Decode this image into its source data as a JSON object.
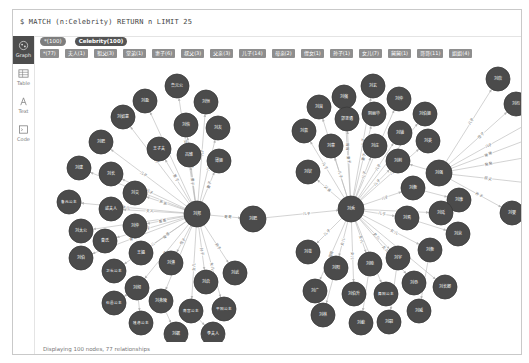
{
  "query": {
    "text": "$ MATCH (n:Celebrity) RETURN n LIMIT 25"
  },
  "sidebar": {
    "items": [
      {
        "id": "graph",
        "label": "Graph",
        "icon": "graph-icon",
        "active": true
      },
      {
        "id": "table",
        "label": "Table",
        "icon": "table-icon",
        "active": false
      },
      {
        "id": "text",
        "label": "Text",
        "icon": "text-icon",
        "active": false
      },
      {
        "id": "code",
        "label": "Code",
        "icon": "code-icon",
        "active": false
      }
    ]
  },
  "labels": [
    {
      "text": "*(100)",
      "style": "light"
    },
    {
      "text": "Celebrity(100)",
      "style": "dark"
    }
  ],
  "relationship_types": [
    "*(77)",
    "夫人(1)",
    "祖父(3)",
    "堂弟(1)",
    "妻子(6)",
    "叔父(3)",
    "父亲(3)",
    "儿子(14)",
    "母亲(2)",
    "侄女(1)",
    "孙子(1)",
    "女儿(7)",
    "舅舅(1)",
    "哥哥(11)",
    "姐姐(4)"
  ],
  "status": {
    "text": "Displaying 100 nodes, 77 relationships"
  },
  "colors": {
    "node": "#4b4b4b",
    "node_stroke": "#3a3a3a",
    "edge": "#b5b5b5",
    "node_text": "#ffffff",
    "edge_text": "#666666"
  },
  "graph": {
    "nodes": [
      {
        "id": "L",
        "x": 196,
        "y": 213,
        "label": "刘邦"
      },
      {
        "id": "M",
        "x": 252,
        "y": 218,
        "label": "刘肥"
      },
      {
        "id": "R",
        "x": 350,
        "y": 208,
        "label": "刘秀"
      },
      {
        "id": "R2",
        "x": 438,
        "y": 172,
        "label": "刘强"
      },
      {
        "id": "l1",
        "x": 176,
        "y": 85,
        "label": "鲁元公"
      },
      {
        "id": "l2",
        "x": 144,
        "y": 100,
        "label": "刘盈"
      },
      {
        "id": "l3",
        "x": 205,
        "y": 101,
        "label": "刘恒"
      },
      {
        "id": "l4",
        "x": 122,
        "y": 116,
        "label": "刘如意"
      },
      {
        "id": "l5",
        "x": 185,
        "y": 124,
        "label": "刘恢"
      },
      {
        "id": "l6",
        "x": 217,
        "y": 127,
        "label": "刘友"
      },
      {
        "id": "l7",
        "x": 100,
        "y": 141,
        "label": "刘肥"
      },
      {
        "id": "l8",
        "x": 158,
        "y": 148,
        "label": "王子夫"
      },
      {
        "id": "l9",
        "x": 188,
        "y": 154,
        "label": "吕雉"
      },
      {
        "id": "l10",
        "x": 218,
        "y": 160,
        "label": "薄姬"
      },
      {
        "id": "l11",
        "x": 78,
        "y": 167,
        "label": "刘建"
      },
      {
        "id": "l12",
        "x": 110,
        "y": 173,
        "label": "刘长"
      },
      {
        "id": "l13",
        "x": 134,
        "y": 192,
        "label": "刘交"
      },
      {
        "id": "l14",
        "x": 68,
        "y": 201,
        "label": "鲁元公主"
      },
      {
        "id": "l15",
        "x": 110,
        "y": 208,
        "label": "戚夫人"
      },
      {
        "id": "l16",
        "x": 80,
        "y": 230,
        "label": "刘太公"
      },
      {
        "id": "l17",
        "x": 134,
        "y": 225,
        "label": "刘仲"
      },
      {
        "id": "l18",
        "x": 104,
        "y": 240,
        "label": "曹氏"
      },
      {
        "id": "l19",
        "x": 80,
        "y": 257,
        "label": "刘伯"
      },
      {
        "id": "l20",
        "x": 140,
        "y": 252,
        "label": "王媪"
      },
      {
        "id": "l21",
        "x": 113,
        "y": 270,
        "label": "卫长公主"
      },
      {
        "id": "l22",
        "x": 170,
        "y": 262,
        "label": "刘濞"
      },
      {
        "id": "l23",
        "x": 205,
        "y": 281,
        "label": "刘启"
      },
      {
        "id": "l24",
        "x": 234,
        "y": 272,
        "label": "刘武"
      },
      {
        "id": "l25",
        "x": 136,
        "y": 287,
        "label": "刘彻"
      },
      {
        "id": "l26",
        "x": 113,
        "y": 302,
        "label": "石邑公主"
      },
      {
        "id": "l27",
        "x": 160,
        "y": 300,
        "label": "刘弗陵"
      },
      {
        "id": "l28",
        "x": 190,
        "y": 310,
        "label": "南宫公主"
      },
      {
        "id": "l29",
        "x": 223,
        "y": 308,
        "label": "平阳公主"
      },
      {
        "id": "l30",
        "x": 140,
        "y": 322,
        "label": "隆虑公主"
      },
      {
        "id": "l31",
        "x": 175,
        "y": 333,
        "label": "刘据"
      },
      {
        "id": "l32",
        "x": 212,
        "y": 333,
        "label": "李夫人"
      },
      {
        "id": "r1",
        "x": 372,
        "y": 85,
        "label": "刘玄"
      },
      {
        "id": "r2",
        "x": 343,
        "y": 96,
        "label": "刘縯"
      },
      {
        "id": "r3",
        "x": 318,
        "y": 106,
        "label": "刘良"
      },
      {
        "id": "r4",
        "x": 398,
        "y": 98,
        "label": "刘仲"
      },
      {
        "id": "r5",
        "x": 346,
        "y": 118,
        "label": "郭圣通"
      },
      {
        "id": "r6",
        "x": 373,
        "y": 113,
        "label": "阴丽华"
      },
      {
        "id": "r7",
        "x": 424,
        "y": 113,
        "label": "刘伯姬"
      },
      {
        "id": "r8",
        "x": 303,
        "y": 130,
        "label": "刘嘉"
      },
      {
        "id": "r9",
        "x": 330,
        "y": 145,
        "label": "刘章"
      },
      {
        "id": "r10",
        "x": 374,
        "y": 145,
        "label": "刘庄"
      },
      {
        "id": "r11",
        "x": 399,
        "y": 132,
        "label": "刘辅"
      },
      {
        "id": "r12",
        "x": 427,
        "y": 140,
        "label": "刘英"
      },
      {
        "id": "r13",
        "x": 307,
        "y": 171,
        "label": "刘钦"
      },
      {
        "id": "r14",
        "x": 397,
        "y": 160,
        "label": "刘荆"
      },
      {
        "id": "r15",
        "x": 412,
        "y": 187,
        "label": "刘衡"
      },
      {
        "id": "r16",
        "x": 458,
        "y": 199,
        "label": "刘康"
      },
      {
        "id": "r17",
        "x": 440,
        "y": 212,
        "label": "刘延"
      },
      {
        "id": "r18",
        "x": 406,
        "y": 217,
        "label": "刘焉"
      },
      {
        "id": "r19",
        "x": 457,
        "y": 233,
        "label": "刘京"
      },
      {
        "id": "r20",
        "x": 307,
        "y": 251,
        "label": "刘苍"
      },
      {
        "id": "r21",
        "x": 335,
        "y": 267,
        "label": "刘阳"
      },
      {
        "id": "r22",
        "x": 369,
        "y": 263,
        "label": "刘睦"
      },
      {
        "id": "r23",
        "x": 397,
        "y": 257,
        "label": "刘宇"
      },
      {
        "id": "r24",
        "x": 429,
        "y": 249,
        "label": "刘衡"
      },
      {
        "id": "r25",
        "x": 314,
        "y": 290,
        "label": "刘广"
      },
      {
        "id": "r26",
        "x": 353,
        "y": 293,
        "label": "刘伯升"
      },
      {
        "id": "r27",
        "x": 385,
        "y": 293,
        "label": "舞阳公主"
      },
      {
        "id": "r28",
        "x": 413,
        "y": 282,
        "label": "刘恭"
      },
      {
        "id": "r29",
        "x": 444,
        "y": 286,
        "label": "刘长卿"
      },
      {
        "id": "r30",
        "x": 322,
        "y": 314,
        "label": "刘林"
      },
      {
        "id": "r31",
        "x": 360,
        "y": 322,
        "label": "刘歙"
      },
      {
        "id": "r32",
        "x": 388,
        "y": 321,
        "label": "刘嗣"
      },
      {
        "id": "r33",
        "x": 418,
        "y": 310,
        "label": "刘威"
      },
      {
        "id": "e1",
        "x": 497,
        "y": 78,
        "label": "刘欣"
      },
      {
        "id": "e2",
        "x": 515,
        "y": 103,
        "label": "刘衎"
      },
      {
        "id": "e3",
        "x": 511,
        "y": 212,
        "label": "刘婴"
      }
    ],
    "edges": [
      {
        "s": "L",
        "t": "M",
        "label": "哥哥"
      },
      {
        "s": "M",
        "t": "R",
        "label": "儿子"
      },
      {
        "s": "L",
        "t": "l1",
        "label": "女儿"
      },
      {
        "s": "L",
        "t": "l2",
        "label": "儿子"
      },
      {
        "s": "L",
        "t": "l3",
        "label": "儿子"
      },
      {
        "s": "L",
        "t": "l4",
        "label": "儿子"
      },
      {
        "s": "L",
        "t": "l5",
        "label": "儿子"
      },
      {
        "s": "L",
        "t": "l6",
        "label": "儿子"
      },
      {
        "s": "L",
        "t": "l7",
        "label": "儿子"
      },
      {
        "s": "L",
        "t": "l8",
        "label": "妻子"
      },
      {
        "s": "L",
        "t": "l9",
        "label": "妻子"
      },
      {
        "s": "L",
        "t": "l10",
        "label": "妻子"
      },
      {
        "s": "L",
        "t": "l11",
        "label": "儿子"
      },
      {
        "s": "L",
        "t": "l12",
        "label": "儿子"
      },
      {
        "s": "L",
        "t": "l13",
        "label": "弟弟"
      },
      {
        "s": "L",
        "t": "l14",
        "label": "女儿"
      },
      {
        "s": "L",
        "t": "l15",
        "label": "夫人"
      },
      {
        "s": "L",
        "t": "l16",
        "label": "父亲"
      },
      {
        "s": "L",
        "t": "l17",
        "label": "哥哥"
      },
      {
        "s": "L",
        "t": "l18",
        "label": "妻子"
      },
      {
        "s": "L",
        "t": "l19",
        "label": "哥哥"
      },
      {
        "s": "L",
        "t": "l20",
        "label": "母亲"
      },
      {
        "s": "L",
        "t": "l21",
        "label": "女儿"
      },
      {
        "s": "L",
        "t": "l22",
        "label": "侄子"
      },
      {
        "s": "L",
        "t": "l23",
        "label": "孙子"
      },
      {
        "s": "L",
        "t": "l24",
        "label": "孙子"
      },
      {
        "s": "L",
        "t": "l25",
        "label": "儿子"
      },
      {
        "s": "L",
        "t": "l27",
        "label": "儿子"
      },
      {
        "s": "L",
        "t": "l28",
        "label": "女儿"
      },
      {
        "s": "L",
        "t": "l29",
        "label": "女儿"
      },
      {
        "s": "l25",
        "t": "l26",
        "label": ""
      },
      {
        "s": "l25",
        "t": "l30",
        "label": ""
      },
      {
        "s": "l27",
        "t": "l31",
        "label": ""
      },
      {
        "s": "l28",
        "t": "l32",
        "label": ""
      },
      {
        "s": "R",
        "t": "r1",
        "label": "儿子"
      },
      {
        "s": "R",
        "t": "r2",
        "label": "哥哥"
      },
      {
        "s": "R",
        "t": "r3",
        "label": "叔父"
      },
      {
        "s": "R",
        "t": "r4",
        "label": "哥哥"
      },
      {
        "s": "R",
        "t": "r5",
        "label": "妻子"
      },
      {
        "s": "R",
        "t": "r6",
        "label": "妻子"
      },
      {
        "s": "R",
        "t": "r7",
        "label": "姐姐"
      },
      {
        "s": "R",
        "t": "r8",
        "label": "儿子"
      },
      {
        "s": "R",
        "t": "r9",
        "label": "儿子"
      },
      {
        "s": "R",
        "t": "r10",
        "label": "儿子"
      },
      {
        "s": "R",
        "t": "r11",
        "label": "儿子"
      },
      {
        "s": "R",
        "t": "r12",
        "label": "儿子"
      },
      {
        "s": "R",
        "t": "r13",
        "label": "父亲"
      },
      {
        "s": "R",
        "t": "r14",
        "label": "儿子"
      },
      {
        "s": "R",
        "t": "r15",
        "label": "儿子"
      },
      {
        "s": "R",
        "t": "r17",
        "label": "儿子"
      },
      {
        "s": "R",
        "t": "r18",
        "label": "儿子"
      },
      {
        "s": "R",
        "t": "r20",
        "label": "儿子"
      },
      {
        "s": "R",
        "t": "r21",
        "label": "女儿"
      },
      {
        "s": "R",
        "t": "r22",
        "label": "女儿"
      },
      {
        "s": "R",
        "t": "r23",
        "label": "女儿"
      },
      {
        "s": "R",
        "t": "r24",
        "label": "女儿"
      },
      {
        "s": "R",
        "t": "r25",
        "label": "哥哥"
      },
      {
        "s": "R",
        "t": "r26",
        "label": "女儿"
      },
      {
        "s": "R",
        "t": "r27",
        "label": "女儿"
      },
      {
        "s": "R",
        "t": "r28",
        "label": "女儿"
      },
      {
        "s": "R",
        "t": "r29",
        "label": "女儿"
      },
      {
        "s": "r15",
        "t": "r16",
        "label": ""
      },
      {
        "s": "r18",
        "t": "r19",
        "label": ""
      },
      {
        "s": "r21",
        "t": "r30",
        "label": ""
      },
      {
        "s": "r22",
        "t": "r31",
        "label": ""
      },
      {
        "s": "r23",
        "t": "r32",
        "label": ""
      },
      {
        "s": "r24",
        "t": "r33",
        "label": ""
      },
      {
        "s": "R2",
        "t": "e1",
        "label": "儿子"
      },
      {
        "s": "R2",
        "t": "e2",
        "label": "侄子"
      },
      {
        "s": "R2",
        "t": "e3",
        "label": "孙子"
      },
      {
        "s": "R2",
        "t": "r14",
        "label": ""
      },
      {
        "s": "R2",
        "t": "E4",
        "label": "哥哥",
        "x2": 528,
        "y2": 138
      },
      {
        "s": "R2",
        "t": "E5",
        "label": "舅舅",
        "x2": 528,
        "y2": 156
      },
      {
        "s": "R2",
        "t": "E6",
        "label": "叔父",
        "x2": 528,
        "y2": 182
      },
      {
        "s": "R2",
        "t": "E7",
        "label": "儿子",
        "x2": 528,
        "y2": 122
      }
    ]
  }
}
